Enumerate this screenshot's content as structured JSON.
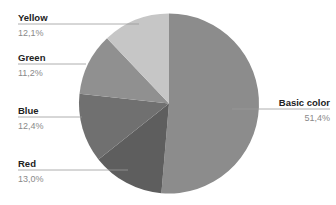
{
  "chart_data": {
    "type": "pie",
    "title": "",
    "start": "top",
    "direction": "clockwise",
    "slices": [
      {
        "label": "Basic color",
        "value": 51.4,
        "display": "51,4%",
        "color": "#8c8c8c",
        "label_side": "right"
      },
      {
        "label": "Red",
        "value": 13.0,
        "display": "13,0%",
        "color": "#5e5e5e",
        "label_side": "left"
      },
      {
        "label": "Blue",
        "value": 12.4,
        "display": "12,4%",
        "color": "#707070",
        "label_side": "left"
      },
      {
        "label": "Green",
        "value": 11.2,
        "display": "11,2%",
        "color": "#909090",
        "label_side": "left"
      },
      {
        "label": "Yellow",
        "value": 12.1,
        "display": "12,1%",
        "color": "#c6c6c6",
        "label_side": "left"
      }
    ],
    "legend": "none",
    "label_style": "leader-lines"
  }
}
